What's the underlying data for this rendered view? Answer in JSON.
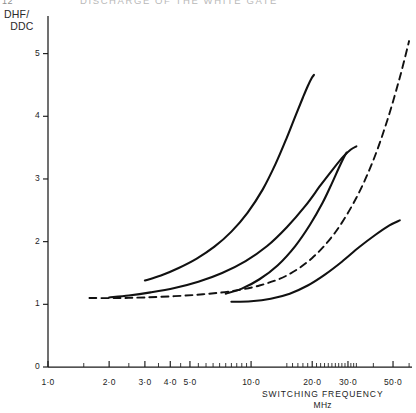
{
  "header": {
    "folio": "12",
    "running_title": "DISCHARGE OF THE WHITE GATE"
  },
  "axes": {
    "y_title": "DHF/\n  DDC",
    "x_title": "SWITCHING  FREQUENCY",
    "x_units": "MHz"
  },
  "chart_data": {
    "type": "line",
    "title": "",
    "xlabel": "SWITCHING FREQUENCY MHz",
    "ylabel": "DHF/DDC",
    "xscale": "log",
    "xlim": [
      1.0,
      62.0
    ],
    "ylim": [
      0,
      5.6
    ],
    "grid": false,
    "legend": null,
    "xticks": [
      1.0,
      2.0,
      3.0,
      4.0,
      5.0,
      10.0,
      20.0,
      30.0,
      50.0
    ],
    "xtick_labels": [
      "1·0",
      "2·0",
      "3·0",
      "4·0",
      "5·0",
      "10·0",
      "20·0",
      "30·0",
      "50·0"
    ],
    "yticks": [
      0,
      1,
      2,
      3,
      4,
      5
    ],
    "ytick_labels": [
      "0",
      "1",
      "2",
      "3",
      "4",
      "5"
    ],
    "series": [
      {
        "name": "curve-1",
        "style": "solid",
        "x": [
          3.0,
          3.6,
          4.4,
          5.4,
          6.6,
          8.0,
          9.6,
          11.4,
          13.2,
          15.0,
          16.6,
          18.0,
          19.0,
          19.8,
          20.4
        ],
        "y": [
          1.38,
          1.46,
          1.58,
          1.73,
          1.92,
          2.16,
          2.46,
          2.83,
          3.24,
          3.66,
          4.02,
          4.3,
          4.48,
          4.6,
          4.66
        ]
      },
      {
        "name": "curve-2",
        "style": "solid",
        "x": [
          2.0,
          2.5,
          3.2,
          4.2,
          5.5,
          7.2,
          9.4,
          12.0,
          15.0,
          18.5,
          22.0,
          25.5,
          28.5,
          31.0,
          33.0
        ],
        "y": [
          1.11,
          1.14,
          1.19,
          1.26,
          1.36,
          1.5,
          1.69,
          1.93,
          2.23,
          2.57,
          2.9,
          3.17,
          3.36,
          3.47,
          3.52
        ]
      },
      {
        "name": "curve-3",
        "style": "solid",
        "x": [
          7.5,
          9.0,
          11.0,
          13.5,
          16.5,
          19.5,
          22.5,
          25.0,
          27.0,
          28.5,
          29.5
        ],
        "y": [
          1.17,
          1.25,
          1.4,
          1.62,
          1.93,
          2.27,
          2.62,
          2.93,
          3.17,
          3.33,
          3.42
        ]
      },
      {
        "name": "curve-4",
        "style": "solid",
        "x": [
          8.0,
          10.0,
          12.5,
          15.5,
          19.0,
          23.0,
          28.0,
          34.0,
          41.0,
          48.0,
          54.0
        ],
        "y": [
          1.04,
          1.05,
          1.09,
          1.17,
          1.3,
          1.47,
          1.68,
          1.91,
          2.11,
          2.26,
          2.34
        ]
      },
      {
        "name": "curve-5-dashed",
        "style": "dashed",
        "x": [
          1.6,
          2.2,
          3.0,
          4.2,
          5.8,
          8.0,
          11.0,
          15.0,
          20.0,
          26.0,
          33.0,
          40.0,
          47.0,
          54.0,
          60.0
        ],
        "y": [
          1.1,
          1.1,
          1.11,
          1.13,
          1.16,
          1.21,
          1.3,
          1.46,
          1.74,
          2.15,
          2.7,
          3.3,
          3.95,
          4.62,
          5.2
        ]
      }
    ]
  }
}
